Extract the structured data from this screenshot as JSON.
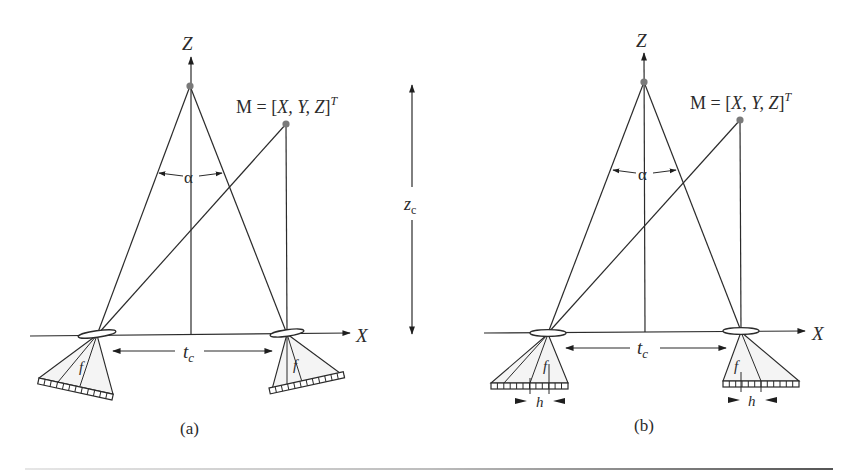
{
  "figure": {
    "panels": [
      {
        "id": "a",
        "caption": "(a)",
        "z_axis_label": "Z",
        "x_axis_label": "X",
        "point_label_prefix": "M = [",
        "point_label_vars": "X, Y, Z",
        "point_label_suffix": "]",
        "point_label_sup": "T",
        "angle_label": "α",
        "baseline_label": "t",
        "baseline_sub": "c",
        "focal_label_left": "f",
        "focal_label_right": "f",
        "configuration": "converging (toed-in) cameras"
      },
      {
        "id": "b",
        "caption": "(b)",
        "z_axis_label": "Z",
        "x_axis_label": "X",
        "point_label_prefix": "M = [",
        "point_label_vars": "X, Y, Z",
        "point_label_suffix": "]",
        "point_label_sup": "T",
        "angle_label": "α",
        "baseline_label": "t",
        "baseline_sub": "c",
        "focal_label_left": "f",
        "focal_label_right": "f",
        "shift_label_left": "h",
        "shift_label_right": "h",
        "configuration": "parallel cameras with sensor shift"
      }
    ],
    "convergence_distance_label": "z",
    "convergence_distance_sub": "c"
  }
}
